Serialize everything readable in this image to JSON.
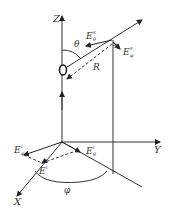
{
  "diagram": {
    "axes": {
      "z_label": "Z",
      "y_label": "Y",
      "x_label": "X"
    },
    "origin_label": "O",
    "angles": {
      "theta": "θ",
      "phi": "φ"
    },
    "distance_label": "R",
    "fields": {
      "scattered_theta": {
        "base": "E",
        "sup": "s",
        "sub": "θ"
      },
      "scattered_phi": {
        "base": "E",
        "sup": "s",
        "sub": "φ"
      },
      "incident_phi": {
        "base": "E",
        "sup": "i",
        "sub": "φ"
      },
      "incident_theta": {
        "base": "E",
        "sup": "i",
        "sub": "θ"
      },
      "incident": {
        "base": "E",
        "sup": "i"
      }
    }
  }
}
